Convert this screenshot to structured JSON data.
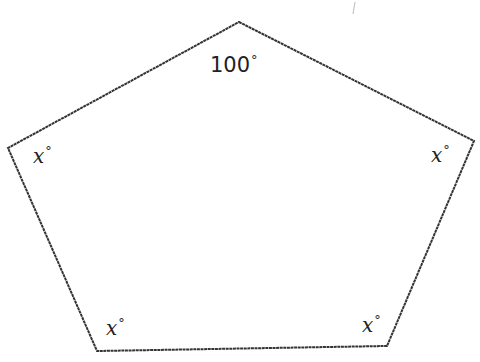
{
  "figure": {
    "shape": "pentagon",
    "stroke_color": "#333333",
    "background": "#ffffff",
    "vertices": [
      {
        "name": "top",
        "x": 239,
        "y": 22
      },
      {
        "name": "right",
        "x": 474,
        "y": 141
      },
      {
        "name": "bottom-right",
        "x": 387,
        "y": 346
      },
      {
        "name": "bottom-left",
        "x": 97,
        "y": 351
      },
      {
        "name": "left",
        "x": 8,
        "y": 148
      }
    ],
    "angles": {
      "top": {
        "value": "100",
        "unit": "°"
      },
      "left": {
        "value": "x",
        "unit": "°"
      },
      "right": {
        "value": "x",
        "unit": "°"
      },
      "bottom_left": {
        "value": "x",
        "unit": "°"
      },
      "bottom_right": {
        "value": "x",
        "unit": "°"
      }
    }
  }
}
